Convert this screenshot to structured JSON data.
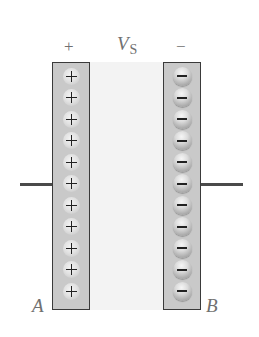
{
  "diagram": {
    "type": "parallel-plate-capacitor",
    "labels": {
      "positive_terminal": "+",
      "negative_terminal": "−",
      "voltage_symbol": "V",
      "voltage_subscript": "S",
      "plate_a": "A",
      "plate_b": "B"
    },
    "plate_a": {
      "charge_sign": "positive",
      "charge_count": 11,
      "charge_glyph": "+"
    },
    "plate_b": {
      "charge_sign": "negative",
      "charge_count": 11,
      "charge_glyph": "−"
    },
    "colors": {
      "plate_fill": "#c9c9c9",
      "plate_border": "#3a3a3a",
      "gap_fill": "#f3f3f3",
      "wire": "#4a4a4a",
      "label_text": "#707070"
    }
  }
}
